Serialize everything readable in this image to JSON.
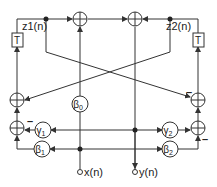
{
  "labels": {
    "z1": "z1(n)",
    "z2": "z2(n)",
    "T1": "T",
    "T2": "T",
    "x": "x(n)",
    "y": "y(n)",
    "minus": "–"
  },
  "coeffs": {
    "beta0": "β",
    "beta0_sub": "0",
    "gamma1": "γ",
    "gamma1_sub": "1",
    "gamma2": "γ",
    "gamma2_sub": "2",
    "beta1": "β",
    "beta1_sub": "1",
    "beta2": "β",
    "beta2_sub": "2"
  },
  "colors": {
    "line": "#333333"
  }
}
